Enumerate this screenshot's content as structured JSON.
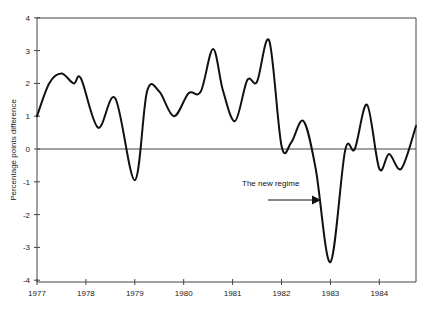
{
  "chart_data": {
    "type": "line",
    "title": "",
    "xlabel": "",
    "ylabel": "Percentage points difference",
    "ylim": [
      -4,
      4
    ],
    "xlim": [
      1977,
      1984.75
    ],
    "grid": false,
    "legend": null,
    "y_ticks": [
      "4",
      "3",
      "2",
      "1",
      "0",
      "-1",
      "-2",
      "-3",
      "-4"
    ],
    "x_ticks": [
      "1977",
      "1978",
      "1979",
      "1980",
      "1981",
      "1982",
      "1983",
      "1984"
    ],
    "annotation": {
      "text": "The new regime",
      "points_to": {
        "x": 1982.85,
        "y": -1.5
      }
    },
    "series": [
      {
        "name": "Percentage points difference",
        "x": [
          1977.0,
          1977.25,
          1977.5,
          1977.75,
          1977.9,
          1978.25,
          1978.6,
          1979.0,
          1979.25,
          1979.5,
          1979.8,
          1980.1,
          1980.35,
          1980.6,
          1980.8,
          1981.05,
          1981.3,
          1981.5,
          1981.75,
          1982.0,
          1982.2,
          1982.45,
          1982.7,
          1983.0,
          1983.3,
          1983.5,
          1983.75,
          1984.0,
          1984.2,
          1984.45,
          1984.75
        ],
        "values": [
          1.0,
          2.0,
          2.3,
          2.0,
          2.15,
          0.65,
          1.55,
          -0.95,
          1.75,
          1.75,
          1.0,
          1.7,
          1.75,
          3.05,
          1.8,
          0.85,
          2.1,
          2.05,
          3.3,
          0.1,
          0.2,
          0.85,
          -0.6,
          -3.45,
          -0.05,
          0.0,
          1.35,
          -0.6,
          -0.15,
          -0.6,
          0.7
        ]
      }
    ]
  }
}
